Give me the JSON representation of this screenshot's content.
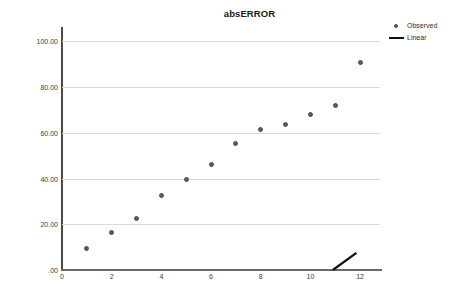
{
  "chart_data": {
    "type": "scatter",
    "title": "absERROR",
    "xlabel": "",
    "ylabel": "",
    "xlim": [
      0,
      12.8
    ],
    "ylim": [
      0,
      105
    ],
    "grid": true,
    "legend_position": "top-right",
    "x": [
      1,
      2,
      3,
      4,
      5,
      6,
      7,
      8,
      9,
      10,
      11,
      12
    ],
    "series": [
      {
        "name": "Observed",
        "marker": "circle",
        "color": "#5a5a60",
        "values": [
          9.5,
          16.5,
          22.5,
          32.5,
          39.5,
          46.0,
          55.5,
          61.5,
          63.5,
          68.0,
          72.0,
          91.0
        ]
      },
      {
        "name": "Linear",
        "marker": "line",
        "color": "#111111",
        "segment": {
          "x0": 10.9,
          "y0": 0.0,
          "x1": 11.85,
          "y1": 7.5
        }
      }
    ],
    "y_ticks": [
      {
        "value": 100,
        "label": "100.00"
      },
      {
        "value": 80,
        "label": "80.00"
      },
      {
        "value": 60,
        "label": "60.00"
      },
      {
        "value": 40,
        "label": "40.00"
      },
      {
        "value": 20,
        "label": "20.00"
      },
      {
        "value": 0,
        "label": ".00"
      }
    ],
    "x_ticks": [
      {
        "value": 0,
        "label": "0"
      },
      {
        "value": 2,
        "label": "2"
      },
      {
        "value": 4,
        "label": "4"
      },
      {
        "value": 6,
        "label": "6"
      },
      {
        "value": 8,
        "label": "8"
      },
      {
        "value": 10,
        "label": "10"
      },
      {
        "value": 12,
        "label": "12"
      }
    ]
  },
  "legend": {
    "items": [
      {
        "label": "Observed",
        "key": "dot"
      },
      {
        "label": "Linear",
        "key": "line"
      }
    ]
  },
  "x_axis_caption": ""
}
